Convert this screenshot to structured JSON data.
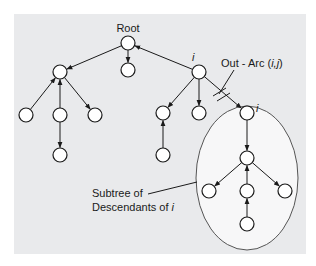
{
  "panel": {
    "background": "#e9eaec",
    "x": 14,
    "y": 14,
    "width": 292,
    "height": 240
  },
  "labels": {
    "root": "Root",
    "node_i": "i",
    "node_j": "i",
    "out_arc_prefix": "Out - Arc (",
    "out_arc_vars": "i,j",
    "out_arc_suffix": ")",
    "subtree_line1": "Subtree of",
    "subtree_line2_prefix": "Descendants of ",
    "subtree_line2_var": "i"
  },
  "nodes": [
    {
      "id": "root",
      "x": 128,
      "y": 43
    },
    {
      "id": "a",
      "x": 60,
      "y": 72
    },
    {
      "id": "b",
      "x": 128,
      "y": 70
    },
    {
      "id": "i",
      "x": 199,
      "y": 72
    },
    {
      "id": "a1",
      "x": 26,
      "y": 115
    },
    {
      "id": "a2",
      "x": 60,
      "y": 115
    },
    {
      "id": "a3",
      "x": 95,
      "y": 115
    },
    {
      "id": "a2c",
      "x": 60,
      "y": 155
    },
    {
      "id": "i1",
      "x": 163,
      "y": 113
    },
    {
      "id": "i2",
      "x": 199,
      "y": 113
    },
    {
      "id": "i1c",
      "x": 163,
      "y": 155
    },
    {
      "id": "j",
      "x": 247,
      "y": 113
    },
    {
      "id": "j1",
      "x": 247,
      "y": 158
    },
    {
      "id": "j1a",
      "x": 209,
      "y": 191
    },
    {
      "id": "j1b",
      "x": 247,
      "y": 191
    },
    {
      "id": "j1c",
      "x": 285,
      "y": 191
    },
    {
      "id": "j1bc",
      "x": 247,
      "y": 224
    }
  ],
  "edges": [
    {
      "from": "root",
      "to": "a"
    },
    {
      "from": "root",
      "to": "b"
    },
    {
      "from": "i",
      "to": "root"
    },
    {
      "from": "a1",
      "to": "a"
    },
    {
      "from": "a2",
      "to": "a"
    },
    {
      "from": "a",
      "to": "a3"
    },
    {
      "from": "a2",
      "to": "a2c"
    },
    {
      "from": "i",
      "to": "i1"
    },
    {
      "from": "i",
      "to": "i2"
    },
    {
      "from": "i1c",
      "to": "i1"
    },
    {
      "from": "i",
      "to": "j"
    },
    {
      "from": "j",
      "to": "j1"
    },
    {
      "from": "j1",
      "to": "j1a"
    },
    {
      "from": "j1b",
      "to": "j1"
    },
    {
      "from": "j1",
      "to": "j1c"
    },
    {
      "from": "j1bc",
      "to": "j1b"
    }
  ],
  "subtree_ellipse": {
    "cx": 247,
    "cy": 178,
    "rx": 51,
    "ry": 72
  }
}
